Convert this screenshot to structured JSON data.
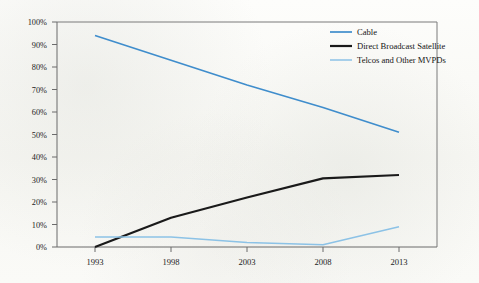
{
  "chart_data": {
    "type": "line",
    "title": "",
    "subtitle": "",
    "xlabel": "",
    "ylabel": "",
    "x": [
      1993,
      1998,
      2003,
      2008,
      2013
    ],
    "categories": [
      "1993",
      "1998",
      "2003",
      "2008",
      "2013"
    ],
    "xtick_labels": [
      "1993",
      "1998",
      "2003",
      "2008",
      "2013"
    ],
    "ytick_labels": [
      "0%",
      "10%",
      "20%",
      "30%",
      "40%",
      "50%",
      "60%",
      "70%",
      "80%",
      "90%",
      "100%"
    ],
    "ytick_values": [
      0,
      10,
      20,
      30,
      40,
      50,
      60,
      70,
      80,
      90,
      100
    ],
    "ylim": [
      0,
      100
    ],
    "xlim": [
      1993,
      2013
    ],
    "grid": false,
    "legend_position": "top-right",
    "series": [
      {
        "name": "Cable",
        "color": "#3f8dcc",
        "width": 1.7,
        "values": [
          94,
          83,
          72,
          62,
          51
        ]
      },
      {
        "name": "Direct Broadcast Satellite",
        "color": "#1a1a1a",
        "width": 2.2,
        "values": [
          0,
          13,
          22,
          30.5,
          32
        ]
      },
      {
        "name": "Telcos and Other MVPDs",
        "color": "#8cc2e6",
        "width": 1.5,
        "values": [
          4.5,
          4.5,
          2,
          1,
          9
        ]
      }
    ]
  },
  "legend": {
    "entries": [
      {
        "label": "Cable",
        "color": "#3f8dcc"
      },
      {
        "label": "Direct Broadcast Satellite",
        "color": "#1a1a1a"
      },
      {
        "label": "Telcos and Other MVPDs",
        "color": "#8cc2e6"
      }
    ]
  },
  "axes": {
    "y_axis_name": "percent-axis",
    "x_axis_name": "year-axis"
  },
  "colors": {
    "background": "#fbfbf9",
    "frame": "#7a7a7a",
    "text": "#1c1c1c"
  }
}
